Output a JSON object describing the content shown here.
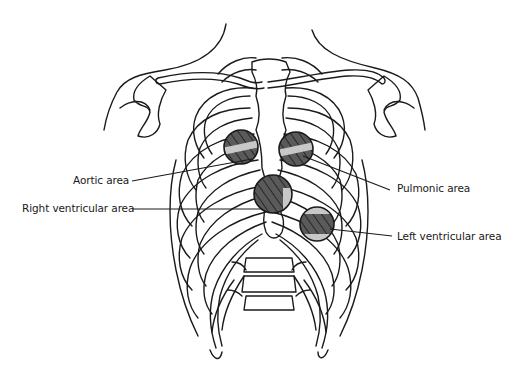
{
  "diagram": {
    "labels": {
      "aortic": "Aortic area",
      "right_ventricular": "Right ventricular area",
      "pulmonic": "Pulmonic area",
      "left_ventricular": "Left ventricular area"
    },
    "colors": {
      "line": "#1a1a1a",
      "area_fill_dark": "#5a5a5a",
      "area_fill_light": "#c8c8c8",
      "background": "#ffffff"
    }
  }
}
